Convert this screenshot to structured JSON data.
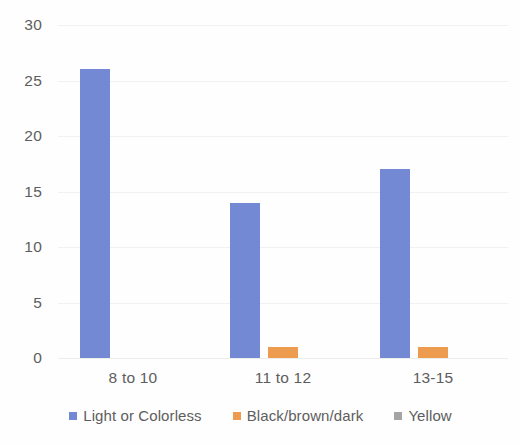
{
  "chart_data": {
    "type": "bar",
    "title": "",
    "subtitle": "",
    "xlabel": "",
    "ylabel": "",
    "categories": [
      "8 to 10",
      "11 to 12",
      "13-15"
    ],
    "series": [
      {
        "name": "Light or Colorless",
        "color": "#7389D4",
        "values": [
          26,
          14,
          17
        ]
      },
      {
        "name": "Black/brown/dark",
        "color": "#ED9C4F",
        "values": [
          0,
          1,
          1
        ]
      },
      {
        "name": "Yellow",
        "color": "#A5A5A5",
        "values": [
          0,
          0,
          0
        ]
      }
    ],
    "ylim": [
      0,
      30
    ],
    "yticks": [
      0,
      5,
      10,
      15,
      20,
      25,
      30
    ],
    "ytick_labels": [
      "0",
      "5",
      "10",
      "15",
      "20",
      "25",
      "30"
    ],
    "grid": true,
    "grid_axis": "y",
    "legend_position": "bottom",
    "legend": [
      "Light or Colorless",
      "Black/brown/dark",
      "Yellow"
    ],
    "annotations": []
  },
  "colors": {
    "background": "#fefefe",
    "gridline": "#f1f1f1",
    "tick_text": "#5d5d5d",
    "series_1": "#7389D4",
    "series_2": "#ED9C4F",
    "series_3": "#A5A5A5"
  }
}
